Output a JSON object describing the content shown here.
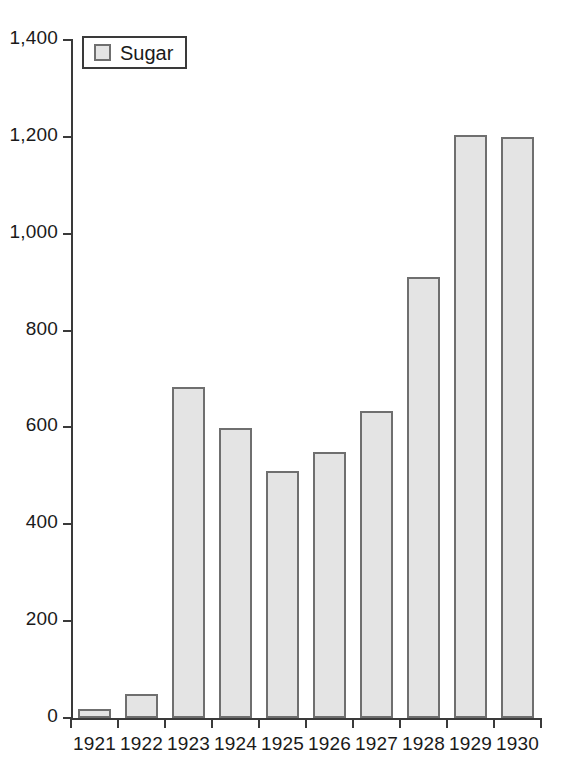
{
  "chart_data": {
    "type": "bar",
    "title": "",
    "xlabel": "",
    "ylabel": "",
    "categories": [
      "1921",
      "1922",
      "1923",
      "1924",
      "1925",
      "1926",
      "1927",
      "1928",
      "1929",
      "1930"
    ],
    "series": [
      {
        "name": "Sugar",
        "values": [
          18,
          50,
          684,
          598,
          511,
          549,
          633,
          910,
          1203,
          1199
        ]
      }
    ],
    "ylim": [
      0,
      1400
    ],
    "yticks": [
      0,
      200,
      400,
      600,
      800,
      1000,
      1200,
      1400
    ],
    "ytick_labels": [
      "0",
      "200",
      "400",
      "600",
      "800",
      "1,000",
      "1,200",
      "1,400"
    ],
    "grid": false,
    "legend": {
      "position": "top-left",
      "entries": [
        "Sugar"
      ]
    },
    "colors": {
      "bar_fill": "#e4e4e4",
      "bar_border": "#6f6f6f",
      "axis": "#3a3a3a",
      "text": "#1a1a1a",
      "background": "#ffffff"
    }
  }
}
